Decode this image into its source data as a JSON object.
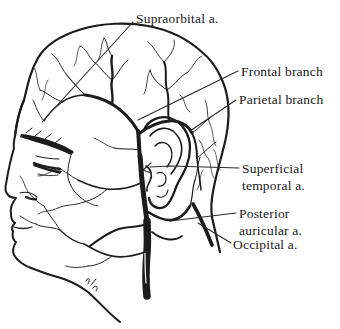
{
  "figure": {
    "kind": "anatomical-line-drawing",
    "view": "lateral head profile with superficial arteries"
  },
  "colors": {
    "background": "#ffffff",
    "ink": "#1c1c1c",
    "leader": "#2a2a2a"
  },
  "labels": [
    {
      "id": "supraorbital-artery",
      "text": "Supraorbital a."
    },
    {
      "id": "frontal-branch",
      "text": "Frontal branch"
    },
    {
      "id": "parietal-branch",
      "text": "Parietal branch"
    },
    {
      "id": "superficial-temporal-artery",
      "text": "Superficial temporal a."
    },
    {
      "id": "posterior-auricular-artery",
      "text": "Posterior auricular a."
    },
    {
      "id": "occipital-artery",
      "text": "Occipital a."
    }
  ]
}
